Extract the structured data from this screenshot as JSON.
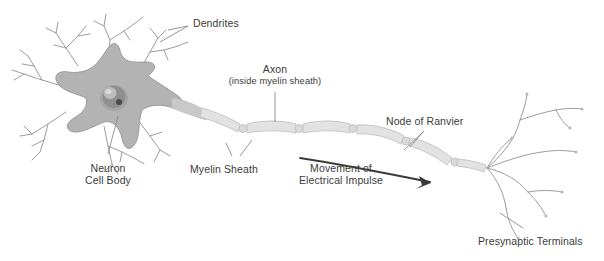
{
  "diagram": {
    "type": "biological-diagram",
    "background_color": "#ffffff",
    "colors": {
      "soma_fill": "#b3b3b3",
      "soma_edge": "#9a9a9a",
      "nucleus_fill": "#8f8f8f",
      "nucleus_highlight": "#cfcfcf",
      "nucleolus": "#4a4a4a",
      "myelin_fill": "#e2e2e2",
      "myelin_edge": "#c2c2c2",
      "branch_stroke": "#9d9d9d",
      "label_text": "#3b3b3b",
      "leader_line": "#8a8a8a",
      "arrow": "#3a3a3a"
    }
  },
  "labels": {
    "dendrites": "Dendrites",
    "axon": "Axon",
    "axon_sub": "(inside myelin sheath)",
    "node_of_ranvier": "Node of Ranvier",
    "neuron_cell_body_line1": "Neuron",
    "neuron_cell_body_line2": "Cell Body",
    "myelin_sheath": "Myelin Sheath",
    "movement_line1": "Movement of",
    "movement_line2": "Electrical Impulse",
    "presynaptic_terminals": "Presynaptic Terminals"
  },
  "parts": {
    "soma": "neuron-cell-body",
    "nucleus": "nucleus",
    "dendrite_count": 6,
    "myelin_segment_count": 6,
    "node_count": 5,
    "terminal_branch_count": 9,
    "impulse_direction": "left-to-right"
  }
}
